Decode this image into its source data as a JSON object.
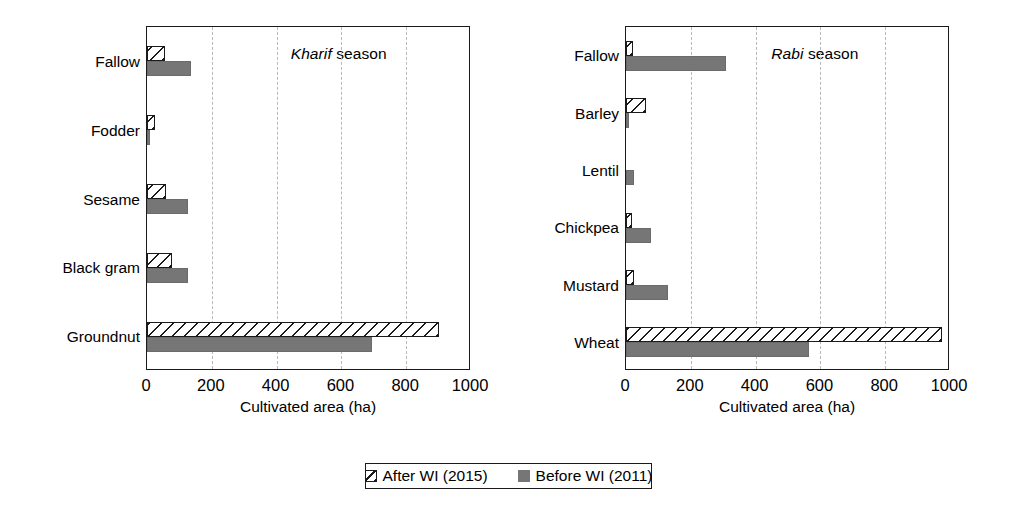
{
  "chart_data": [
    {
      "type": "bar",
      "orientation": "horizontal",
      "title": "Kharif season",
      "title_italic_word": "Kharif",
      "xlabel": "Cultivated area (ha)",
      "ylabel": "",
      "xlim": [
        0,
        1000
      ],
      "xticks": [
        0,
        200,
        400,
        600,
        800,
        1000
      ],
      "gridlines_at": [
        200,
        400,
        600,
        800
      ],
      "grid": "vertical-dashed",
      "categories": [
        "Fallow",
        "Fodder",
        "Sesame",
        "Black gram",
        "Groundnut"
      ],
      "series": [
        {
          "name": "After WI (2015)",
          "values": [
            55,
            25,
            60,
            78,
            900
          ]
        },
        {
          "name": "Before WI (2011)",
          "values": [
            135,
            8,
            128,
            125,
            695
          ]
        }
      ]
    },
    {
      "type": "bar",
      "orientation": "horizontal",
      "title": "Rabi season",
      "title_italic_word": "Rabi",
      "xlabel": "Cultivated area (ha)",
      "ylabel": "",
      "xlim": [
        0,
        1000
      ],
      "xticks": [
        0,
        200,
        400,
        600,
        800,
        1000
      ],
      "gridlines_at": [
        200,
        400,
        600,
        800
      ],
      "grid": "vertical-dashed",
      "categories": [
        "Fallow",
        "Barley",
        "Lentil",
        "Chickpea",
        "Mustard",
        "Wheat"
      ],
      "series": [
        {
          "name": "After WI (2015)",
          "values": [
            22,
            62,
            0,
            18,
            25,
            975
          ]
        },
        {
          "name": "Before WI (2011)",
          "values": [
            310,
            8,
            25,
            78,
            130,
            565
          ]
        }
      ]
    }
  ],
  "legend": {
    "position": "bottom-center",
    "entries": [
      {
        "label": "After WI (2015)",
        "pattern": "diagonal-hatch",
        "color": "#ffffff"
      },
      {
        "label": "Before WI (2011)",
        "pattern": "solid",
        "color": "#767676"
      }
    ]
  },
  "panels": {
    "left": {
      "season_italic": "Kharif",
      "season_rest": " season",
      "axis_title": "Cultivated area (ha)",
      "tick_labels": [
        "0",
        "200",
        "400",
        "600",
        "800",
        "1000"
      ],
      "categories": [
        {
          "label": "Fallow",
          "after": 55,
          "before": 135
        },
        {
          "label": "Fodder",
          "after": 25,
          "before": 8
        },
        {
          "label": "Sesame",
          "after": 60,
          "before": 128
        },
        {
          "label": "Black gram",
          "after": 78,
          "before": 125
        },
        {
          "label": "Groundnut",
          "after": 900,
          "before": 695
        }
      ]
    },
    "right": {
      "season_italic": "Rabi",
      "season_rest": " season",
      "axis_title": "Cultivated area (ha)",
      "tick_labels": [
        "0",
        "200",
        "400",
        "600",
        "800",
        "1000"
      ],
      "categories": [
        {
          "label": "Fallow",
          "after": 22,
          "before": 310
        },
        {
          "label": "Barley",
          "after": 62,
          "before": 8
        },
        {
          "label": "Lentil",
          "after": 0,
          "before": 25
        },
        {
          "label": "Chickpea",
          "after": 18,
          "before": 78
        },
        {
          "label": "Mustard",
          "after": 25,
          "before": 130
        },
        {
          "label": "Wheat",
          "after": 975,
          "before": 565
        }
      ]
    }
  },
  "colors": {
    "axis": "#1a1a1a",
    "grid": "#b9b9b9",
    "before_fill": "#767676",
    "after_fill": "#ffffff",
    "text": "#000000"
  }
}
